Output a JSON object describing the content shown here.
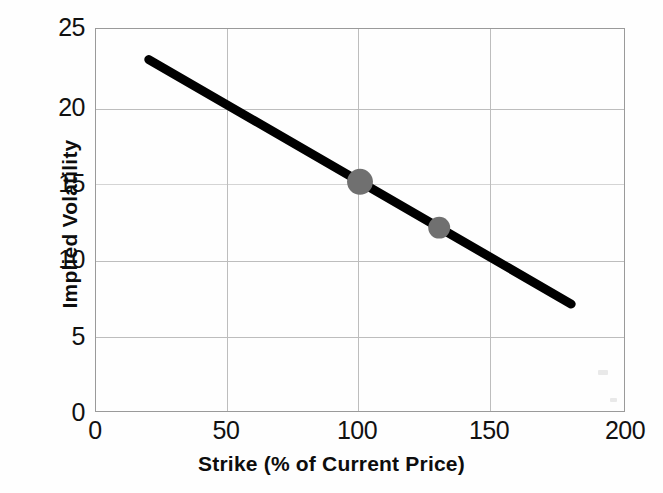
{
  "chart_data": {
    "type": "line",
    "title": "",
    "xlabel": "Strike (% of Current Price)",
    "ylabel": "Implied Volatility",
    "xlim": [
      0,
      200
    ],
    "ylim": [
      0,
      25
    ],
    "xticks": [
      0,
      50,
      100,
      150,
      200
    ],
    "yticks": [
      0,
      5,
      10,
      15,
      20,
      25
    ],
    "xtick_labels": [
      "0",
      "50",
      "100",
      "150",
      "200"
    ],
    "ytick_labels": [
      "0",
      "5",
      "10",
      "15",
      "20",
      "25"
    ],
    "grid": true,
    "legend": null,
    "series": [
      {
        "name": "Implied volatility skew",
        "x": [
          20,
          180
        ],
        "y": [
          23,
          7
        ],
        "color": "#000000",
        "linewidth": 9,
        "style": "solid"
      }
    ],
    "markers": [
      {
        "label": "at-the-money",
        "x": 100,
        "y": 15,
        "color": "#707070",
        "radius": 13
      },
      {
        "label": "out-of-the-money",
        "x": 130,
        "y": 12,
        "color": "#707070",
        "radius": 11
      }
    ]
  },
  "axes": {
    "frame_color": "#9a9a9a",
    "grid_color": "#bdbdbd",
    "line_color": "#000000",
    "marker_color": "#707070",
    "background": "#ffffff"
  }
}
